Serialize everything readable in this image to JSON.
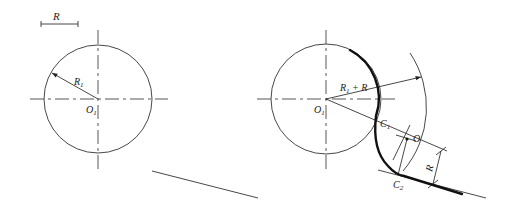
{
  "figure": {
    "scale_bar": {
      "label": "R"
    },
    "left_panel": {
      "circle_label": "R",
      "circle_label_sub": "1",
      "center_label": "O",
      "center_label_sub": "1"
    },
    "right_panel": {
      "center_label": "O",
      "center_label_sub": "1",
      "sum_radius_label": "R",
      "sum_radius_sub": "1",
      "sum_radius_suffix": " + R",
      "tangent_point_1": "C",
      "tangent_point_1_sub": "1",
      "tangent_point_2": "C",
      "tangent_point_2_sub": "2",
      "arc_center_label": "O",
      "offset_label": "R"
    },
    "colors": {
      "line": "#333333",
      "bold": "#111111",
      "background": "#ffffff"
    }
  }
}
